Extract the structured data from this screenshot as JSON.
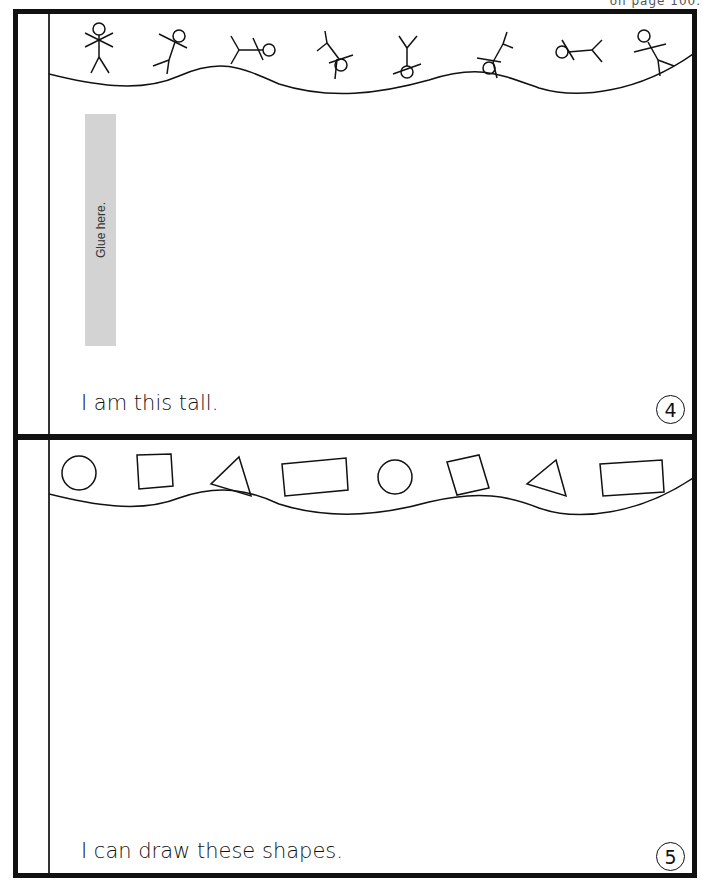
{
  "header": {
    "clipped_text": "on page 100."
  },
  "pages": [
    {
      "number": "4",
      "border_theme": "stick figures",
      "glue_label": "Glue here.",
      "caption": "I am this tall."
    },
    {
      "number": "5",
      "border_theme": "shapes",
      "border_shapes": [
        "circle",
        "square",
        "triangle",
        "rectangle",
        "circle",
        "square",
        "triangle",
        "rectangle"
      ],
      "caption": "I can draw these shapes."
    }
  ]
}
